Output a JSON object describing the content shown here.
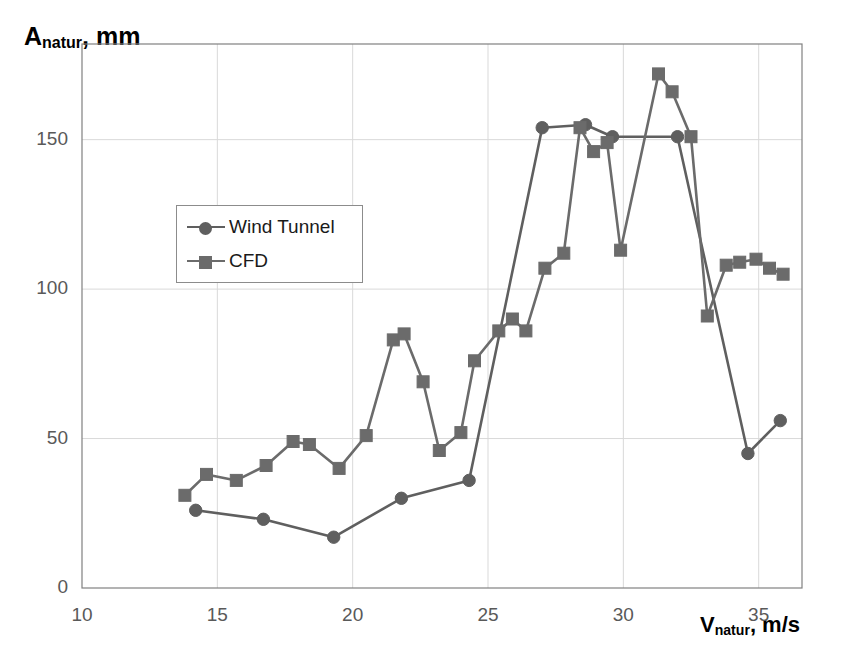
{
  "chart_data": {
    "type": "line",
    "title": "",
    "subtitle": "",
    "xlabel": "V_natur, m/s",
    "ylabel": "A_natur, mm",
    "xlabel_main": "V",
    "xlabel_sub": "natur",
    "xlabel_tail": ", m/s",
    "ylabel_main": "A",
    "ylabel_sub": "natur",
    "ylabel_tail": ", mm",
    "xlim": [
      10,
      36.6
    ],
    "ylim": [
      0,
      182
    ],
    "xticks": [
      10,
      15,
      20,
      25,
      30,
      35
    ],
    "yticks": [
      0,
      50,
      100,
      150
    ],
    "xtick_labels": [
      "10",
      "15",
      "20",
      "25",
      "30",
      "35"
    ],
    "ytick_labels": [
      "0",
      "50",
      "100",
      "150"
    ],
    "grid": true,
    "grid_color": "#d9d9d9",
    "axis_color": "#808080",
    "legend_position": "upper-left-inside",
    "series": [
      {
        "name": "Wind Tunnel",
        "marker": "circle",
        "color": "#5f5f5f",
        "x": [
          14.2,
          16.7,
          19.3,
          21.8,
          24.3,
          27.0,
          28.6,
          29.6,
          32.0,
          34.6,
          35.8
        ],
        "y": [
          26,
          23,
          17,
          30,
          36,
          154,
          155,
          151,
          151,
          45,
          56
        ]
      },
      {
        "name": "CFD",
        "marker": "square",
        "color": "#6b6b6b",
        "x": [
          13.8,
          14.6,
          15.7,
          16.8,
          17.8,
          18.4,
          19.5,
          20.5,
          21.5,
          21.9,
          22.6,
          23.2,
          24.0,
          24.5,
          25.4,
          25.9,
          26.4,
          27.1,
          27.8,
          28.4,
          28.9,
          29.4,
          29.9,
          31.3,
          31.8,
          32.5,
          33.1,
          33.8,
          34.3,
          34.9,
          35.4,
          35.9
        ],
        "y": [
          31,
          38,
          36,
          41,
          49,
          48,
          40,
          51,
          83,
          85,
          69,
          46,
          52,
          76,
          86,
          90,
          86,
          107,
          112,
          154,
          146,
          149,
          113,
          172,
          166,
          151,
          91,
          108,
          109,
          110,
          107,
          105
        ]
      }
    ]
  },
  "legend": {
    "entries": [
      {
        "label": "Wind Tunnel",
        "marker": "circle"
      },
      {
        "label": "CFD",
        "marker": "square"
      }
    ]
  }
}
